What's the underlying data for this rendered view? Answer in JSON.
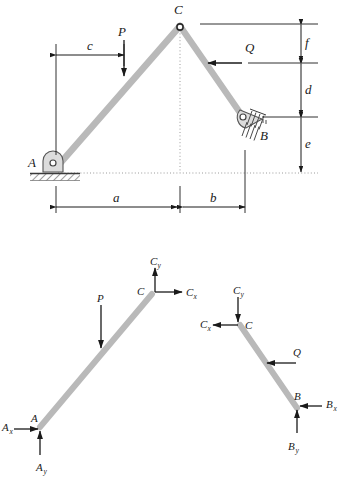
{
  "figure": {
    "type": "engineering-statics-diagram",
    "title_visible": false,
    "colors": {
      "member": "#b9b9b9",
      "member_edge": "#a8a8a8",
      "line": "#1a1a1a",
      "background": "#ffffff"
    }
  },
  "structure": {
    "name": "three-hinged-arch-frame",
    "joints": {
      "A": {
        "label": "A",
        "support": "pin-support-hatched-ground"
      },
      "B": {
        "label": "B",
        "support": "inclined-pin-support-hatched"
      },
      "C": {
        "label": "C",
        "support": "pin-joint-apex"
      }
    },
    "members": [
      {
        "name": "member-AC",
        "from": "A",
        "to": "C"
      },
      {
        "name": "member-CB",
        "from": "C",
        "to": "B"
      }
    ],
    "loads": [
      {
        "name": "load-P",
        "label": "P",
        "direction": "down",
        "applied_on": "member-AC"
      },
      {
        "name": "load-Q",
        "label": "Q",
        "direction": "left",
        "applied_on": "member-CB"
      }
    ],
    "dimensions": {
      "horizontal": [
        {
          "label": "a",
          "name": "dimension-a",
          "span": "A to C-centerline"
        },
        {
          "label": "b",
          "name": "dimension-b",
          "span": "C-centerline to B"
        }
      ],
      "vertical": [
        {
          "label": "f",
          "name": "dimension-f",
          "span": "C to Q line"
        },
        {
          "label": "d",
          "name": "dimension-d",
          "span": "Q line to B"
        },
        {
          "label": "e",
          "name": "dimension-e",
          "span": "B to A base line"
        }
      ],
      "offset": [
        {
          "label": "c",
          "name": "dimension-c",
          "span": "A vertical to P line"
        }
      ]
    }
  },
  "free_body_diagrams": {
    "left": {
      "name": "fbd-member-AC",
      "member_label_A": "A",
      "member_label_C": "C",
      "forces": [
        {
          "name": "force-P",
          "label": "P",
          "direction": "down"
        },
        {
          "name": "force-Cy",
          "label": "C",
          "sub": "y",
          "direction": "up"
        },
        {
          "name": "force-Cx",
          "label": "C",
          "sub": "x",
          "direction": "right"
        },
        {
          "name": "force-Ax",
          "label": "A",
          "sub": "x",
          "direction": "right"
        },
        {
          "name": "force-Ay",
          "label": "A",
          "sub": "y",
          "direction": "up"
        }
      ]
    },
    "right": {
      "name": "fbd-member-CB",
      "member_label_C": "C",
      "member_label_B": "B",
      "forces": [
        {
          "name": "force-Q",
          "label": "Q",
          "direction": "left"
        },
        {
          "name": "force-Cy",
          "label": "C",
          "sub": "y",
          "direction": "down"
        },
        {
          "name": "force-Cx",
          "label": "C",
          "sub": "x",
          "direction": "left"
        },
        {
          "name": "force-Bx",
          "label": "B",
          "sub": "x",
          "direction": "left"
        },
        {
          "name": "force-By",
          "label": "B",
          "sub": "y",
          "direction": "up"
        }
      ]
    }
  },
  "labels": {
    "A": "A",
    "B": "B",
    "C": "C",
    "P": "P",
    "Q": "Q",
    "a": "a",
    "b": "b",
    "c": "c",
    "d": "d",
    "e": "e",
    "f": "f",
    "x": "x",
    "y": "y"
  }
}
